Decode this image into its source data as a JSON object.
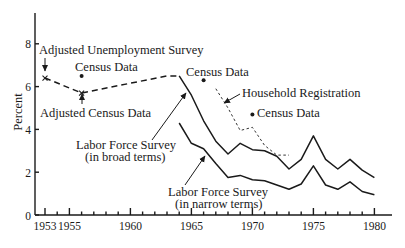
{
  "chart_data": {
    "type": "line",
    "title": "",
    "xlabel": "",
    "ylabel": "Percent",
    "xlim": [
      1953,
      1980
    ],
    "ylim": [
      0,
      8
    ],
    "grid": false,
    "x_ticks_major": [
      1953,
      1955,
      1960,
      1965,
      1970,
      1975,
      1980
    ],
    "x_ticks_minor": [
      1954,
      1956,
      1957,
      1958,
      1959,
      1961,
      1962,
      1963,
      1964,
      1966,
      1967,
      1968,
      1969,
      1971,
      1972,
      1973,
      1974,
      1976,
      1977,
      1978,
      1979
    ],
    "x_tick_labels": [
      "1953",
      "1955",
      "1960",
      "1965",
      "1970",
      "1975",
      "1980"
    ],
    "y_ticks": [
      0,
      2,
      4,
      6,
      8
    ],
    "y_tick_labels": [
      "0",
      "2",
      "4",
      "6",
      "8"
    ],
    "series": [
      {
        "name": "Adjusted Unemployment Survey / Adjusted Census Data",
        "style": "dashed",
        "x": [
          1953,
          1956,
          1963,
          1964
        ],
        "y": [
          6.4,
          5.7,
          6.5,
          6.5
        ]
      },
      {
        "name": "Labor Force Survey (in broad terms)",
        "style": "solid",
        "x": [
          1964,
          1965,
          1966,
          1967,
          1968,
          1969,
          1970,
          1971,
          1972,
          1973,
          1974,
          1975,
          1976,
          1977,
          1978,
          1979,
          1980
        ],
        "y": [
          6.5,
          5.6,
          4.4,
          3.45,
          2.85,
          3.35,
          3.05,
          3.0,
          2.75,
          2.15,
          2.6,
          3.7,
          2.6,
          2.15,
          2.6,
          2.1,
          1.75
        ]
      },
      {
        "name": "Labor Force Survey (in narrow terms)",
        "style": "solid",
        "x": [
          1964,
          1965,
          1966,
          1967,
          1968,
          1969,
          1970,
          1971,
          1972,
          1973,
          1974,
          1975,
          1976,
          1977,
          1978,
          1979,
          1980
        ],
        "y": [
          4.3,
          3.35,
          3.1,
          2.4,
          1.75,
          1.85,
          1.65,
          1.6,
          1.4,
          1.2,
          1.45,
          2.3,
          1.4,
          1.2,
          1.55,
          1.1,
          0.95
        ]
      },
      {
        "name": "Household Registration",
        "style": "dotted",
        "x": [
          1967,
          1968,
          1969,
          1970,
          1971,
          1972,
          1973
        ],
        "y": [
          5.9,
          5.0,
          3.95,
          4.1,
          3.25,
          2.8,
          2.8
        ]
      }
    ],
    "points": [
      {
        "name": "Adjusted Unemployment Survey",
        "marker": "x",
        "x": 1953,
        "y": 6.4
      },
      {
        "name": "Adjusted Census Data",
        "marker": "x",
        "x": 1956,
        "y": 5.7
      },
      {
        "name": "Census Data",
        "marker": "dot",
        "x": 1956,
        "y": 6.5
      },
      {
        "name": "Census Data",
        "marker": "dot",
        "x": 1966,
        "y": 6.3
      },
      {
        "name": "Census Data",
        "marker": "dot",
        "x": 1970,
        "y": 4.7
      }
    ],
    "annotations": {
      "adjusted_unemployment_survey": "Adjusted Unemployment Survey",
      "census_1956": "Census Data",
      "adjusted_census_data": "Adjusted Census Data",
      "census_1966": "Census Data",
      "household_registration": "Household Registration",
      "census_1970": "Census Data",
      "lfs_broad_line1": "Labor Force Survey",
      "lfs_broad_line2": "(in broad terms)",
      "lfs_narrow_line1": "Labor Force Survey",
      "lfs_narrow_line2": "(in narrow terms)"
    }
  }
}
